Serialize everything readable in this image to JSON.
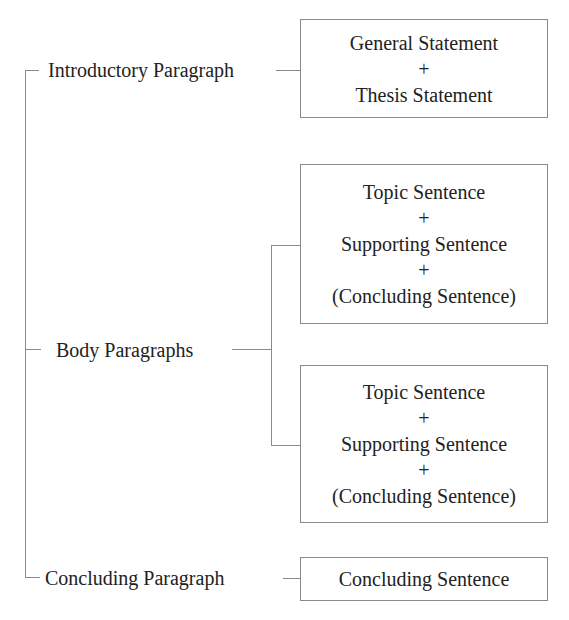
{
  "diagram": {
    "sections": [
      {
        "label": "Introductory Paragraph"
      },
      {
        "label": "Body Paragraphs"
      },
      {
        "label": "Concluding Paragraph"
      }
    ],
    "boxes": {
      "intro": [
        "General Statement",
        "+",
        "Thesis Statement"
      ],
      "body1": [
        "Topic Sentence",
        "+",
        "Supporting Sentence",
        "+",
        "(Concluding Sentence)"
      ],
      "body2": [
        "Topic Sentence",
        "+",
        "Supporting Sentence",
        "+",
        "(Concluding Sentence)"
      ],
      "conclusion": [
        "Concluding Sentence"
      ]
    },
    "colors": {
      "line": "#8a8a8a",
      "text": "#222222",
      "background": "#ffffff"
    }
  }
}
